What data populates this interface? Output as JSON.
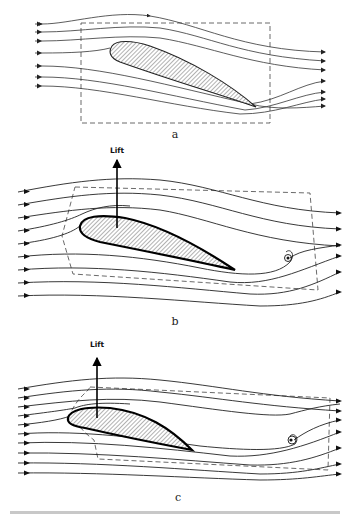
{
  "figure": {
    "panels": [
      {
        "id": "a",
        "label": "a",
        "has_lift": false,
        "description": "Symmetric potential flow around airfoil, no circulation; streamlines wrap around trailing edge"
      },
      {
        "id": "b",
        "label": "b",
        "has_lift": true,
        "lift_label": "Lift",
        "description": "Starting vortex shed at trailing edge; circulation around airfoil produces lift"
      },
      {
        "id": "c",
        "label": "c",
        "has_lift": true,
        "lift_label": "Lift",
        "description": "Starting vortex left downstream; contour encloses airfoil and vortex"
      }
    ],
    "caption": "(caption text truncated at bottom edge, illegible)"
  },
  "colors": {
    "line": "#333333",
    "hatch": "#555555",
    "background": "#ffffff"
  }
}
